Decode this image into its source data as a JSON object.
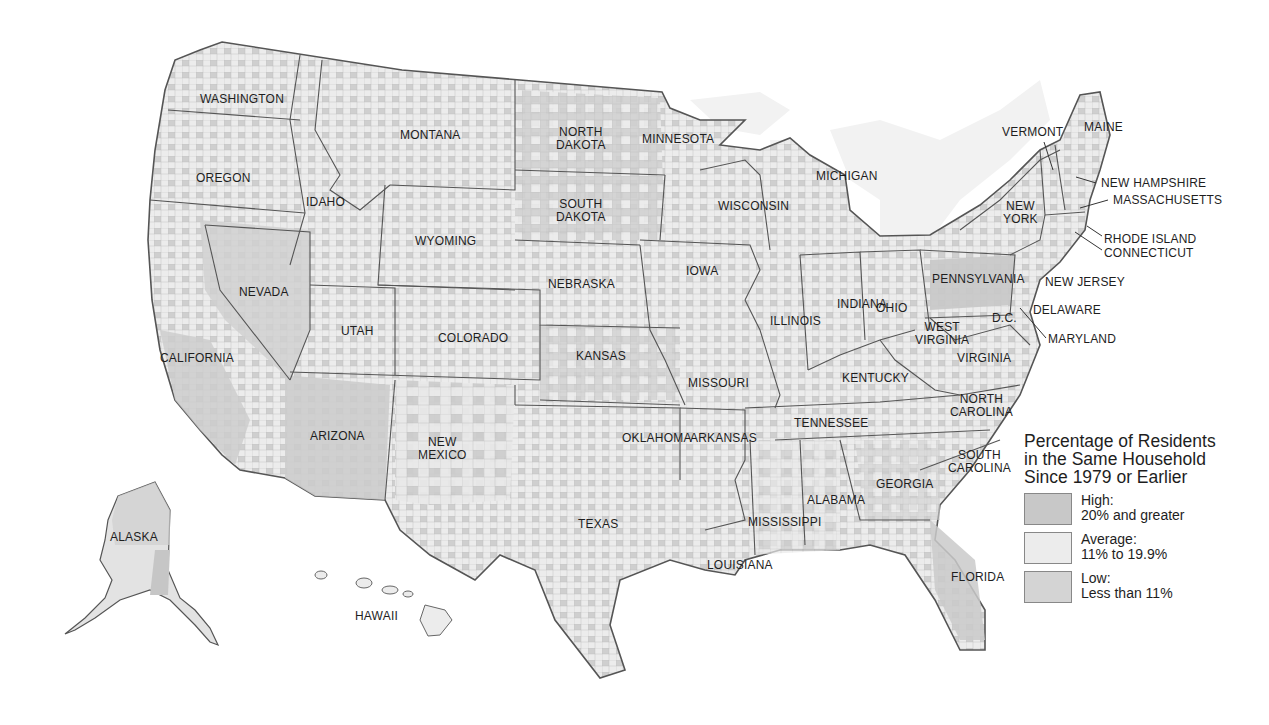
{
  "map": {
    "colors": {
      "high": "#c8c8c8",
      "average": "#ececec",
      "low": "#d4d4d4",
      "border": "#555555",
      "water": "#f2f2f2",
      "background": "#ffffff"
    },
    "state_labels": [
      {
        "id": "washington",
        "text": "WASHINGTON",
        "x": 200,
        "y": 93
      },
      {
        "id": "oregon",
        "text": "OREGON",
        "x": 196,
        "y": 172
      },
      {
        "id": "idaho",
        "text": "IDAHO",
        "x": 306,
        "y": 196
      },
      {
        "id": "montana",
        "text": "MONTANA",
        "x": 400,
        "y": 129
      },
      {
        "id": "wyoming",
        "text": "WYOMING",
        "x": 415,
        "y": 235
      },
      {
        "id": "north-dakota",
        "text": "NORTH\nDAKOTA",
        "x": 556,
        "y": 126
      },
      {
        "id": "south-dakota",
        "text": "SOUTH\nDAKOTA",
        "x": 556,
        "y": 198
      },
      {
        "id": "minnesota",
        "text": "MINNESOTA",
        "x": 642,
        "y": 133
      },
      {
        "id": "nebraska",
        "text": "NEBRASKA",
        "x": 548,
        "y": 278
      },
      {
        "id": "nevada",
        "text": "NEVADA",
        "x": 239,
        "y": 286
      },
      {
        "id": "utah",
        "text": "UTAH",
        "x": 341,
        "y": 325
      },
      {
        "id": "colorado",
        "text": "COLORADO",
        "x": 438,
        "y": 332
      },
      {
        "id": "california",
        "text": "CALIFORNIA",
        "x": 160,
        "y": 352
      },
      {
        "id": "kansas",
        "text": "KANSAS",
        "x": 576,
        "y": 350
      },
      {
        "id": "arizona",
        "text": "ARIZONA",
        "x": 310,
        "y": 430
      },
      {
        "id": "new-mexico",
        "text": "NEW\nMEXICO",
        "x": 418,
        "y": 436
      },
      {
        "id": "oklahoma",
        "text": "OKLAHOMA",
        "x": 622,
        "y": 432
      },
      {
        "id": "texas",
        "text": "TEXAS",
        "x": 578,
        "y": 518
      },
      {
        "id": "iowa",
        "text": "IOWA",
        "x": 686,
        "y": 265
      },
      {
        "id": "wisconsin",
        "text": "WISCONSIN",
        "x": 718,
        "y": 200
      },
      {
        "id": "michigan",
        "text": "MICHIGAN",
        "x": 816,
        "y": 170
      },
      {
        "id": "illinois",
        "text": "ILLINOIS",
        "x": 770,
        "y": 315
      },
      {
        "id": "indiana",
        "text": "INDIANA",
        "x": 837,
        "y": 298
      },
      {
        "id": "ohio",
        "text": "OHIO",
        "x": 876,
        "y": 302
      },
      {
        "id": "missouri",
        "text": "MISSOURI",
        "x": 688,
        "y": 377
      },
      {
        "id": "arkansas",
        "text": "ARKANSAS",
        "x": 690,
        "y": 432
      },
      {
        "id": "kentucky",
        "text": "KENTUCKY",
        "x": 842,
        "y": 372
      },
      {
        "id": "tennessee",
        "text": "TENNESSEE",
        "x": 794,
        "y": 417
      },
      {
        "id": "mississippi",
        "text": "MISSISSIPPI",
        "x": 748,
        "y": 516
      },
      {
        "id": "alabama",
        "text": "ALABAMA",
        "x": 807,
        "y": 494
      },
      {
        "id": "georgia",
        "text": "GEORGIA",
        "x": 876,
        "y": 478
      },
      {
        "id": "louisiana",
        "text": "LOUISIANA",
        "x": 707,
        "y": 559
      },
      {
        "id": "florida",
        "text": "FLORIDA",
        "x": 951,
        "y": 571
      },
      {
        "id": "south-carolina",
        "text": "SOUTH\nCAROLINA",
        "x": 948,
        "y": 449
      },
      {
        "id": "north-carolina",
        "text": "NORTH\nCAROLINA",
        "x": 950,
        "y": 393
      },
      {
        "id": "virginia",
        "text": "VIRGINIA",
        "x": 957,
        "y": 352
      },
      {
        "id": "west-virginia",
        "text": "WEST\nVIRGINIA",
        "x": 915,
        "y": 321
      },
      {
        "id": "pennsylvania",
        "text": "PENNSYLVANIA",
        "x": 932,
        "y": 273
      },
      {
        "id": "new-york",
        "text": "NEW\nYORK",
        "x": 1003,
        "y": 200
      },
      {
        "id": "dc",
        "text": "D.C.",
        "x": 992,
        "y": 312
      },
      {
        "id": "vermont",
        "text": "VERMONT",
        "x": 1002,
        "y": 126
      },
      {
        "id": "maine",
        "text": "MAINE",
        "x": 1084,
        "y": 121
      },
      {
        "id": "new-hampshire",
        "text": "NEW HAMPSHIRE",
        "x": 1101,
        "y": 177
      },
      {
        "id": "massachusetts",
        "text": "MASSACHUSETTS",
        "x": 1113,
        "y": 194
      },
      {
        "id": "rhode-island",
        "text": "RHODE ISLAND",
        "x": 1104,
        "y": 233
      },
      {
        "id": "connecticut",
        "text": "CONNECTICUT",
        "x": 1104,
        "y": 247
      },
      {
        "id": "new-jersey",
        "text": "NEW JERSEY",
        "x": 1045,
        "y": 276
      },
      {
        "id": "delaware",
        "text": "DELAWARE",
        "x": 1033,
        "y": 304
      },
      {
        "id": "maryland",
        "text": "MARYLAND",
        "x": 1048,
        "y": 333
      },
      {
        "id": "alaska",
        "text": "ALASKA",
        "x": 110,
        "y": 531
      },
      {
        "id": "hawaii",
        "text": "HAWAII",
        "x": 355,
        "y": 610
      }
    ]
  },
  "legend": {
    "title_lines": [
      "Percentage of Residents",
      "in the Same Household",
      "Since 1979 or Earlier"
    ],
    "items": [
      {
        "name": "high",
        "label": "High:",
        "range": "20% and greater",
        "color": "#c8c8c8"
      },
      {
        "name": "average",
        "label": "Average:",
        "range": "11% to 19.9%",
        "color": "#ececec"
      },
      {
        "name": "low",
        "label": "Low:",
        "range": "Less than 11%",
        "color": "#d4d4d4"
      }
    ]
  }
}
